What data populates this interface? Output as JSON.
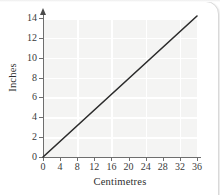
{
  "figure": {
    "background_color": "#ffffff",
    "plot_background_color": "#f4f4f3",
    "gridline_color": "#ffffff",
    "axis_color": "#6e6e6e",
    "line_color": "#2b2b2b"
  },
  "chart_data": {
    "type": "line",
    "title": "",
    "xlabel": "Centimetres",
    "ylabel": "Inches",
    "xlim": [
      0,
      36
    ],
    "ylim": [
      0,
      14.2
    ],
    "x_ticks": [
      0,
      4,
      8,
      12,
      16,
      20,
      24,
      28,
      32,
      36
    ],
    "x_tick_labels": [
      "0",
      "4",
      "8",
      "12",
      "16",
      "20",
      "24",
      "28",
      "32",
      "36"
    ],
    "y_ticks": [
      0,
      2,
      4,
      6,
      8,
      10,
      12,
      14
    ],
    "y_tick_labels": [
      "0",
      "2",
      "4",
      "6",
      "8",
      "10",
      "12",
      "14"
    ],
    "x_gridlines": [
      8,
      16,
      24,
      32
    ],
    "y_gridlines": [
      2,
      4,
      6,
      8,
      10,
      12,
      14
    ],
    "grid": true,
    "legend": false,
    "y_axis_arrow": true,
    "series": [
      {
        "name": "Centimetres to Inches",
        "x": [
          0,
          36
        ],
        "values": [
          0,
          14.2
        ]
      }
    ]
  }
}
